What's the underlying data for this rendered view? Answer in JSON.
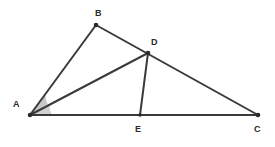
{
  "figure": {
    "background_color": "#ffffff",
    "stroke_color": "#3a3a3a",
    "label_color": "#2b2b2b",
    "angle_fill_color": "#9a9a9a",
    "points": [
      {
        "name": "A",
        "label": "A",
        "x": 30,
        "y": 115,
        "label_x": 13,
        "label_y": 100
      },
      {
        "name": "B",
        "label": "B",
        "x": 96,
        "y": 25,
        "label_x": 95,
        "label_y": 9
      },
      {
        "name": "C",
        "label": "C",
        "x": 258,
        "y": 115,
        "label_x": 254,
        "label_y": 125
      },
      {
        "name": "D",
        "label": "D",
        "x": 148,
        "y": 53,
        "label_x": 151,
        "label_y": 38
      },
      {
        "name": "E",
        "label": "E",
        "x": 140,
        "y": 115,
        "label_x": 135,
        "label_y": 125
      }
    ],
    "segments": [
      {
        "name": "segment-AB",
        "from": "A",
        "to": "B"
      },
      {
        "name": "segment-BC",
        "from": "B",
        "to": "C"
      },
      {
        "name": "segment-AC",
        "from": "A",
        "to": "C"
      },
      {
        "name": "segment-AD",
        "from": "A",
        "to": "D"
      },
      {
        "name": "segment-DE",
        "from": "D",
        "to": "E"
      }
    ],
    "angle_marks": [
      {
        "name": "angle-BAD",
        "vertex": "A",
        "radius": 17
      },
      {
        "name": "angle-DAC",
        "vertex": "A",
        "radius": 15
      }
    ]
  }
}
